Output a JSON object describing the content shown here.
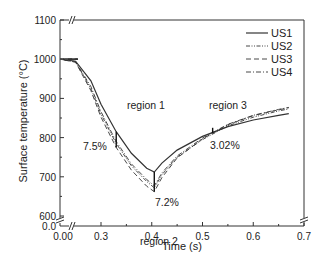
{
  "chart_data": {
    "type": "line",
    "title": "",
    "xlabel": "Time (s)",
    "ylabel": "Surface temperature (°C)",
    "xlim": [
      0.0,
      0.7
    ],
    "ylim": [
      600,
      1100
    ],
    "x_axis_break": true,
    "y_axis_break": true,
    "x_ticks": [
      "0.00",
      "0.3",
      "0.4",
      "0.5",
      "0.6",
      "0.7"
    ],
    "y_ticks": [
      "0.0",
      "600",
      "700",
      "800",
      "900",
      "1000",
      "1100"
    ],
    "grid": false,
    "legend": {
      "position": "upper right",
      "entries": [
        "US1",
        "US2",
        "US3",
        "US4"
      ]
    },
    "series": [
      {
        "name": "US1",
        "style": "solid",
        "x": [
          0.22,
          0.25,
          0.28,
          0.3,
          0.33,
          0.36,
          0.39,
          0.405,
          0.42,
          0.45,
          0.5,
          0.55,
          0.6,
          0.65,
          0.67
        ],
        "y": [
          1000,
          995,
          945,
          885,
          815,
          760,
          722,
          712,
          735,
          768,
          803,
          828,
          845,
          857,
          861
        ]
      },
      {
        "name": "US2",
        "style": "dash-dot-dot",
        "x": [
          0.22,
          0.25,
          0.28,
          0.3,
          0.33,
          0.36,
          0.39,
          0.405,
          0.42,
          0.45,
          0.5,
          0.55,
          0.6,
          0.65,
          0.67
        ],
        "y": [
          1000,
          993,
          925,
          860,
          785,
          728,
          688,
          672,
          705,
          750,
          795,
          830,
          852,
          868,
          873
        ]
      },
      {
        "name": "US3",
        "style": "dashed",
        "x": [
          0.22,
          0.25,
          0.28,
          0.3,
          0.33,
          0.36,
          0.39,
          0.405,
          0.42,
          0.45,
          0.5,
          0.55,
          0.6,
          0.65,
          0.67
        ],
        "y": [
          1000,
          992,
          920,
          852,
          775,
          717,
          676,
          662,
          698,
          748,
          797,
          833,
          856,
          871,
          876
        ]
      },
      {
        "name": "US4",
        "style": "dash-dot",
        "x": [
          0.22,
          0.25,
          0.28,
          0.3,
          0.33,
          0.36,
          0.39,
          0.405,
          0.42,
          0.45,
          0.5,
          0.55,
          0.6,
          0.65,
          0.67
        ],
        "y": [
          1000,
          994,
          930,
          866,
          790,
          733,
          693,
          677,
          710,
          753,
          799,
          834,
          857,
          872,
          877
        ]
      }
    ],
    "annotations": [
      {
        "text": "region 1",
        "x": 0.37,
        "y": 860
      },
      {
        "text": "region 2",
        "x": 0.41,
        "y": 625
      },
      {
        "text": "region 3",
        "x": 0.55,
        "y": 862
      },
      {
        "text": "7.5%",
        "x": 0.285,
        "y": 755
      },
      {
        "text": "7.2%",
        "x": 0.42,
        "y": 668
      },
      {
        "text": "3.02%",
        "x": 0.56,
        "y": 785
      }
    ],
    "markers": [
      {
        "type": "vertical-bar",
        "x": 0.33,
        "y_from": 815,
        "y_to": 775,
        "label": "7.5%"
      },
      {
        "type": "vertical-bar",
        "x": 0.405,
        "y_from": 712,
        "y_to": 662,
        "label": "7.2%"
      },
      {
        "type": "vertical-bar",
        "x": 0.52,
        "y_from": 812,
        "y_to": 825,
        "label": "3.02%"
      }
    ]
  }
}
